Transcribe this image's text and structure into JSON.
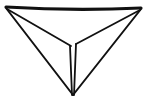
{
  "figure": {
    "background_color": "#ffffff",
    "line_color": "#111111",
    "canvas": {
      "width": 147,
      "height": 103
    },
    "vertices": {
      "top_left": {
        "x": 6,
        "y": 7
      },
      "top_right": {
        "x": 141,
        "y": 8
      },
      "bottom_apex": {
        "x": 73,
        "y": 95
      },
      "center_junction": {
        "x": 73,
        "y": 45
      },
      "strip_top_left": {
        "x": 70,
        "y": 46
      },
      "strip_top_right": {
        "x": 76,
        "y": 44
      }
    },
    "edges": [
      {
        "name": "top-edge",
        "from": "top_left",
        "to": "top_right",
        "path": "M 6 7 Q 73 11 141 8",
        "stroke_width": 3.2
      },
      {
        "name": "left-outer-edge",
        "from": "top_left",
        "to": "bottom_apex",
        "path": "M 6 8 L 73 95",
        "stroke_width": 2.0
      },
      {
        "name": "right-outer-edge",
        "from": "top_right",
        "to": "bottom_apex",
        "path": "M 141 9 L 73 95",
        "stroke_width": 2.0
      },
      {
        "name": "left-inner-edge",
        "from": "top_left",
        "to": "center_junction",
        "path": "M 7 9 L 71 46",
        "stroke_width": 1.8
      },
      {
        "name": "right-inner-edge",
        "from": "top_right",
        "to": "center_junction",
        "path": "M 140 10 L 76 44",
        "stroke_width": 1.8
      },
      {
        "name": "fold-strip-left-edge",
        "from": "strip_top_left",
        "to": "bottom_apex",
        "path": "M 70 46 L 72 95",
        "stroke_width": 1.8
      },
      {
        "name": "fold-strip-right-edge",
        "from": "strip_top_right",
        "to": "bottom_apex",
        "path": "M 76 44 L 74 95",
        "stroke_width": 1.8
      }
    ]
  }
}
